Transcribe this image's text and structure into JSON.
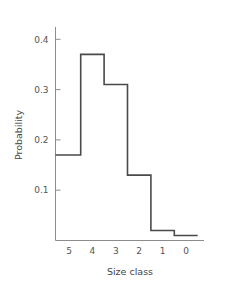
{
  "chart_data": {
    "type": "bar",
    "subtype": "step-histogram",
    "title": "",
    "xlabel": "Size class",
    "ylabel": "Probability",
    "categories": [
      "5",
      "4",
      "3",
      "2",
      "1",
      "0"
    ],
    "values": [
      0.17,
      0.37,
      0.31,
      0.13,
      0.02,
      0.01
    ],
    "xticklabels": [
      "5",
      "4",
      "3",
      "2",
      "1",
      "0"
    ],
    "yticklabels": [
      "0.4",
      "0.3",
      "0.2",
      "0.1"
    ],
    "ytickvalues": [
      0.4,
      0.3,
      0.2,
      0.1
    ],
    "ylim": [
      0.0,
      0.43
    ],
    "xlim": [
      5.5,
      -0.5
    ],
    "x_axis_direction": "descending",
    "grid": false,
    "legend": false,
    "line_color": "#4a4a4a",
    "axis_color": "#8c8c8c",
    "text_color": "#555555",
    "background": "#ffffff"
  },
  "axes": {
    "y_title": "Probability",
    "x_title": "Size class"
  }
}
